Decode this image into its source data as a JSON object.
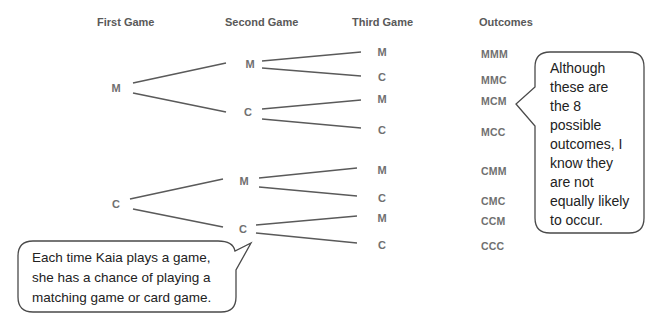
{
  "headers": {
    "first": "First Game",
    "second": "Second Game",
    "third": "Third Game",
    "outcomes": "Outcomes"
  },
  "tree": {
    "first": [
      "M",
      "C"
    ],
    "second": [
      "M",
      "C",
      "M",
      "C"
    ],
    "third": [
      "M",
      "C",
      "M",
      "C",
      "M",
      "C",
      "M",
      "C"
    ]
  },
  "outcomes": [
    "MMM",
    "MMC",
    "MCM",
    "MCC",
    "CMM",
    "CMC",
    "CCM",
    "CCC"
  ],
  "callouts": {
    "right": [
      "Although",
      "these are",
      "the 8",
      "possible",
      "outcomes, I",
      "know they",
      "are not",
      "equally likely",
      "to occur."
    ],
    "left": [
      "Each time Kaia plays a game,",
      "she has a chance of playing a",
      "matching game or card game."
    ]
  }
}
